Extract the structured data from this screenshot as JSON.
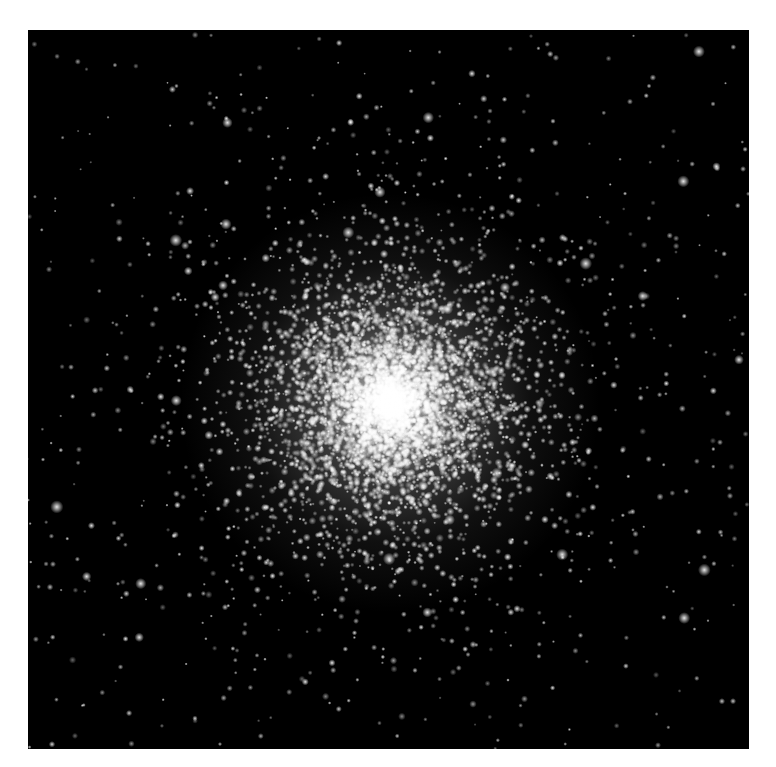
{
  "image": {
    "subject": "globular star cluster",
    "background_color": "#000000",
    "page_background": "#ffffff",
    "frame": {
      "left": 28,
      "top": 30,
      "width": 721,
      "height": 719
    },
    "cluster_center": {
      "x": 362,
      "y": 373
    },
    "star_color": "#ffffff",
    "core_radius": 70,
    "halo_radius": 300,
    "star_counts": {
      "core": 3500,
      "halo": 2500,
      "field": 450,
      "bright": 60
    },
    "seed": 42
  }
}
